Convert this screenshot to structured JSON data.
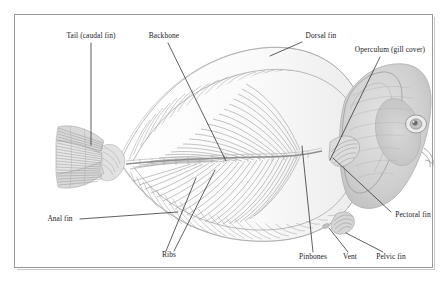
{
  "figure": {
    "background_color": "#ffffff",
    "frame_color": "#9a9a9a",
    "ink_color": "#8c8c8c",
    "leader_color": "#2b2b2b",
    "label_color": "#1a1a1a"
  },
  "labels": [
    {
      "id": "tail",
      "text": "Tail (caudal fin)",
      "x": 91,
      "y": 38,
      "align": "center"
    },
    {
      "id": "backbone",
      "text": "Backbone",
      "x": 164,
      "y": 38,
      "align": "center"
    },
    {
      "id": "dorsal",
      "text": "Dorsal fin",
      "x": 321,
      "y": 38,
      "align": "center"
    },
    {
      "id": "operculum",
      "text": "Operculum (gill cover)",
      "x": 390,
      "y": 52,
      "align": "center"
    },
    {
      "id": "pectoral",
      "text": "Pectoral fin",
      "x": 413,
      "y": 217,
      "align": "center"
    },
    {
      "id": "anal",
      "text": "Anal fin",
      "x": 60,
      "y": 221,
      "align": "center"
    },
    {
      "id": "ribs",
      "text": "Ribs",
      "x": 169,
      "y": 257,
      "align": "center"
    },
    {
      "id": "pinbones",
      "text": "Pinbones",
      "x": 313,
      "y": 259,
      "align": "center"
    },
    {
      "id": "vent",
      "text": "Vent",
      "x": 350,
      "y": 259,
      "align": "center"
    },
    {
      "id": "pelvic",
      "text": "Pelvic fin",
      "x": 391,
      "y": 259,
      "align": "center"
    }
  ],
  "leaders": [
    {
      "id": "tail-leader",
      "points": "91,43 91,145"
    },
    {
      "id": "backbone-leader",
      "points": "168,43 226,161"
    },
    {
      "id": "dorsal-leader",
      "points": "302,42 270,56"
    },
    {
      "id": "operculum-leader",
      "points": "380,57 330,160"
    },
    {
      "id": "pectoral-leader",
      "points": "391,212 333,158"
    },
    {
      "id": "anal-leader",
      "points": "80,219 178,212"
    },
    {
      "id": "ribs-leader-a",
      "points": "166,251 196,178"
    },
    {
      "id": "ribs-leader-b",
      "points": "174,251 215,170"
    },
    {
      "id": "pinbones-leader",
      "points": "313,252 302,146"
    },
    {
      "id": "vent-leader",
      "points": "348,252 329,228"
    },
    {
      "id": "pelvic-leader",
      "points": "383,252 346,233"
    }
  ]
}
